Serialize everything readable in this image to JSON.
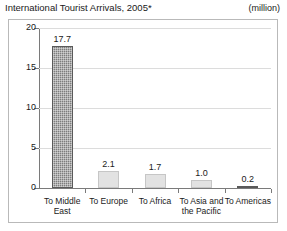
{
  "header": {
    "title": "International Tourist Arrivals, 2005*",
    "unit": "(million)"
  },
  "chart_data": {
    "type": "bar",
    "title": "International Tourist Arrivals, 2005*",
    "xlabel": "",
    "ylabel": "",
    "unit": "million",
    "categories": [
      "To Middle East",
      "To Europe",
      "To Africa",
      "To Asia and the Pacific",
      "To Americas"
    ],
    "values": [
      17.7,
      2.1,
      1.7,
      1.0,
      0.2
    ],
    "value_labels": [
      "17.7",
      "2.1",
      "1.7",
      "1.0",
      "0.2"
    ],
    "ylim": [
      0,
      20
    ],
    "yticks": [
      0,
      5,
      10,
      15,
      20
    ],
    "ytick_labels": [
      "0",
      "5",
      "10",
      "15",
      "20"
    ],
    "grid": true,
    "legend": false,
    "series_colors": [
      "#7d7d7d",
      "#e2e2e2",
      "#e2e2e2",
      "#e2e2e2",
      "#6f6f6f"
    ]
  },
  "style": {
    "grid_color": "#dcdcdc",
    "axis_color": "#7a7a7a",
    "frame_color": "#b9b9b9",
    "text_color": "#1a1a1a",
    "background": "#ffffff"
  }
}
